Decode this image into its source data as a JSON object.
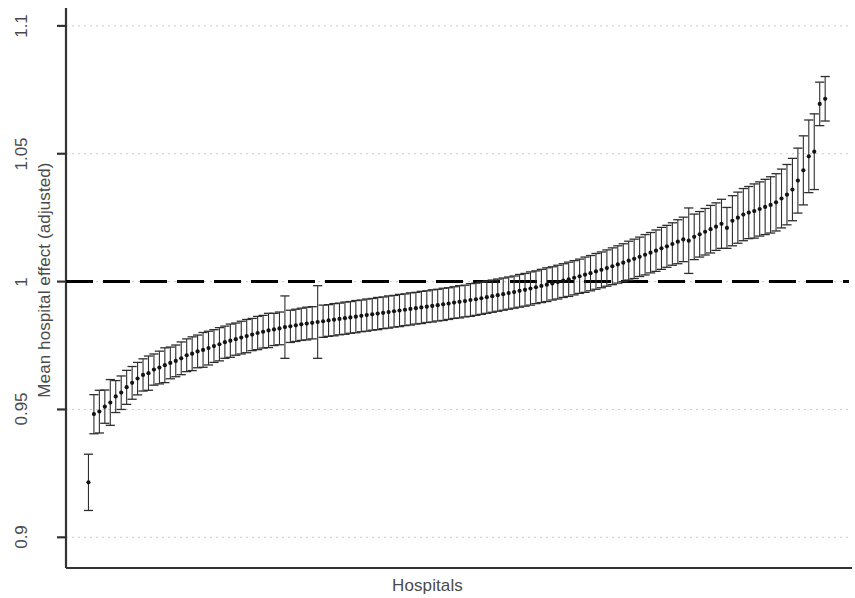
{
  "chart_data": {
    "type": "scatter",
    "title": "",
    "subtitle": "",
    "xlabel": "Hospitals",
    "ylabel": "Mean hospital effect (adjusted)",
    "ylim": [
      0.888,
      1.107
    ],
    "xlim": [
      0,
      140
    ],
    "grid": true,
    "grid_axis": "y",
    "grid_style": "dotted",
    "grid_color": "#c8c8c8",
    "legend": "none",
    "marker": "filled-circle",
    "marker_color": "#1a1a1a",
    "errorbar_style": "capped-vertical",
    "errorbar_color": "#333333",
    "yticks": [
      0.9,
      0.95,
      1,
      1.05,
      1.1
    ],
    "ytick_labels": [
      "0.9",
      "0.95",
      "1",
      "1.05",
      "1.1"
    ],
    "xticks": [],
    "xtick_labels": [],
    "annotations": [
      {
        "type": "hline",
        "y": 1,
        "style": "dashed",
        "color": "#000000",
        "width": 3,
        "label": "reference line at 1"
      }
    ],
    "series_name": "Mean hospital effect (adjusted) with 95% CI",
    "n_points": 136,
    "points": [
      {
        "x": 1,
        "y": 0.9215,
        "lo": 0.9105,
        "hi": 0.9325
      },
      {
        "x": 2,
        "y": 0.9482,
        "lo": 0.9405,
        "hi": 0.9558
      },
      {
        "x": 3,
        "y": 0.9492,
        "lo": 0.9408,
        "hi": 0.9575
      },
      {
        "x": 4,
        "y": 0.9511,
        "lo": 0.9446,
        "hi": 0.9576
      },
      {
        "x": 5,
        "y": 0.9527,
        "lo": 0.9438,
        "hi": 0.9617
      },
      {
        "x": 6,
        "y": 0.9551,
        "lo": 0.9488,
        "hi": 0.9613
      },
      {
        "x": 7,
        "y": 0.9566,
        "lo": 0.95,
        "hi": 0.9631
      },
      {
        "x": 8,
        "y": 0.9587,
        "lo": 0.952,
        "hi": 0.9653
      },
      {
        "x": 9,
        "y": 0.9604,
        "lo": 0.954,
        "hi": 0.9668
      },
      {
        "x": 10,
        "y": 0.9621,
        "lo": 0.9557,
        "hi": 0.9684
      },
      {
        "x": 11,
        "y": 0.9635,
        "lo": 0.9572,
        "hi": 0.9698
      },
      {
        "x": 12,
        "y": 0.9642,
        "lo": 0.9575,
        "hi": 0.9709
      },
      {
        "x": 13,
        "y": 0.9656,
        "lo": 0.9595,
        "hi": 0.9717
      },
      {
        "x": 14,
        "y": 0.9664,
        "lo": 0.96,
        "hi": 0.9728
      },
      {
        "x": 15,
        "y": 0.9673,
        "lo": 0.9605,
        "hi": 0.9741
      },
      {
        "x": 16,
        "y": 0.9682,
        "lo": 0.962,
        "hi": 0.9744
      },
      {
        "x": 17,
        "y": 0.969,
        "lo": 0.9628,
        "hi": 0.9752
      },
      {
        "x": 18,
        "y": 0.97,
        "lo": 0.9636,
        "hi": 0.9764
      },
      {
        "x": 19,
        "y": 0.9712,
        "lo": 0.9648,
        "hi": 0.9776
      },
      {
        "x": 20,
        "y": 0.9718,
        "lo": 0.9652,
        "hi": 0.9784
      },
      {
        "x": 21,
        "y": 0.9727,
        "lo": 0.9663,
        "hi": 0.9791
      },
      {
        "x": 22,
        "y": 0.9733,
        "lo": 0.9665,
        "hi": 0.9801
      },
      {
        "x": 23,
        "y": 0.974,
        "lo": 0.9674,
        "hi": 0.9806
      },
      {
        "x": 24,
        "y": 0.9748,
        "lo": 0.9684,
        "hi": 0.9812
      },
      {
        "x": 25,
        "y": 0.9755,
        "lo": 0.969,
        "hi": 0.982
      },
      {
        "x": 26,
        "y": 0.9763,
        "lo": 0.97,
        "hi": 0.9826
      },
      {
        "x": 27,
        "y": 0.9769,
        "lo": 0.9704,
        "hi": 0.9834
      },
      {
        "x": 28,
        "y": 0.9775,
        "lo": 0.9712,
        "hi": 0.9838
      },
      {
        "x": 29,
        "y": 0.9781,
        "lo": 0.9717,
        "hi": 0.9845
      },
      {
        "x": 30,
        "y": 0.9787,
        "lo": 0.9722,
        "hi": 0.9852
      },
      {
        "x": 31,
        "y": 0.9793,
        "lo": 0.973,
        "hi": 0.9856
      },
      {
        "x": 32,
        "y": 0.9799,
        "lo": 0.9734,
        "hi": 0.9864
      },
      {
        "x": 33,
        "y": 0.9804,
        "lo": 0.974,
        "hi": 0.9868
      },
      {
        "x": 34,
        "y": 0.9809,
        "lo": 0.9742,
        "hi": 0.9876
      },
      {
        "x": 35,
        "y": 0.9813,
        "lo": 0.975,
        "hi": 0.9876
      },
      {
        "x": 36,
        "y": 0.9817,
        "lo": 0.9753,
        "hi": 0.9881
      },
      {
        "x": 37,
        "y": 0.9822,
        "lo": 0.97,
        "hi": 0.9944
      },
      {
        "x": 38,
        "y": 0.9825,
        "lo": 0.9762,
        "hi": 0.9888
      },
      {
        "x": 39,
        "y": 0.9829,
        "lo": 0.9766,
        "hi": 0.9892
      },
      {
        "x": 40,
        "y": 0.9833,
        "lo": 0.977,
        "hi": 0.9896
      },
      {
        "x": 41,
        "y": 0.9836,
        "lo": 0.9772,
        "hi": 0.99
      },
      {
        "x": 42,
        "y": 0.9839,
        "lo": 0.9776,
        "hi": 0.9902
      },
      {
        "x": 43,
        "y": 0.9842,
        "lo": 0.97,
        "hi": 0.9984
      },
      {
        "x": 44,
        "y": 0.9845,
        "lo": 0.9782,
        "hi": 0.9908
      },
      {
        "x": 45,
        "y": 0.9848,
        "lo": 0.9786,
        "hi": 0.991
      },
      {
        "x": 46,
        "y": 0.9851,
        "lo": 0.9788,
        "hi": 0.9914
      },
      {
        "x": 47,
        "y": 0.9854,
        "lo": 0.9792,
        "hi": 0.9916
      },
      {
        "x": 48,
        "y": 0.9857,
        "lo": 0.9794,
        "hi": 0.992
      },
      {
        "x": 49,
        "y": 0.986,
        "lo": 0.9798,
        "hi": 0.9922
      },
      {
        "x": 50,
        "y": 0.9863,
        "lo": 0.98,
        "hi": 0.9926
      },
      {
        "x": 51,
        "y": 0.9866,
        "lo": 0.9804,
        "hi": 0.9928
      },
      {
        "x": 52,
        "y": 0.9869,
        "lo": 0.9806,
        "hi": 0.9932
      },
      {
        "x": 53,
        "y": 0.9872,
        "lo": 0.981,
        "hi": 0.9934
      },
      {
        "x": 54,
        "y": 0.9875,
        "lo": 0.9812,
        "hi": 0.9938
      },
      {
        "x": 55,
        "y": 0.9878,
        "lo": 0.9816,
        "hi": 0.994
      },
      {
        "x": 56,
        "y": 0.9881,
        "lo": 0.9818,
        "hi": 0.9944
      },
      {
        "x": 57,
        "y": 0.9884,
        "lo": 0.9822,
        "hi": 0.9946
      },
      {
        "x": 58,
        "y": 0.9887,
        "lo": 0.9824,
        "hi": 0.995
      },
      {
        "x": 59,
        "y": 0.989,
        "lo": 0.9828,
        "hi": 0.9952
      },
      {
        "x": 60,
        "y": 0.9893,
        "lo": 0.983,
        "hi": 0.9956
      },
      {
        "x": 61,
        "y": 0.9896,
        "lo": 0.9834,
        "hi": 0.9958
      },
      {
        "x": 62,
        "y": 0.9899,
        "lo": 0.9836,
        "hi": 0.9962
      },
      {
        "x": 63,
        "y": 0.9902,
        "lo": 0.984,
        "hi": 0.9964
      },
      {
        "x": 64,
        "y": 0.9905,
        "lo": 0.9842,
        "hi": 0.9968
      },
      {
        "x": 65,
        "y": 0.9908,
        "lo": 0.9846,
        "hi": 0.997
      },
      {
        "x": 66,
        "y": 0.9911,
        "lo": 0.9848,
        "hi": 0.9974
      },
      {
        "x": 67,
        "y": 0.9914,
        "lo": 0.9852,
        "hi": 0.9976
      },
      {
        "x": 68,
        "y": 0.9918,
        "lo": 0.9856,
        "hi": 0.998
      },
      {
        "x": 69,
        "y": 0.9921,
        "lo": 0.9858,
        "hi": 0.9984
      },
      {
        "x": 70,
        "y": 0.9924,
        "lo": 0.9862,
        "hi": 0.9986
      },
      {
        "x": 71,
        "y": 0.9928,
        "lo": 0.9864,
        "hi": 0.9992
      },
      {
        "x": 72,
        "y": 0.9931,
        "lo": 0.9868,
        "hi": 0.9994
      },
      {
        "x": 73,
        "y": 0.9935,
        "lo": 0.9872,
        "hi": 0.9998
      },
      {
        "x": 74,
        "y": 0.9939,
        "lo": 0.9876,
        "hi": 1.0002
      },
      {
        "x": 75,
        "y": 0.9943,
        "lo": 0.988,
        "hi": 1.0006
      },
      {
        "x": 76,
        "y": 0.9947,
        "lo": 0.9884,
        "hi": 1.001
      },
      {
        "x": 77,
        "y": 0.9951,
        "lo": 0.9888,
        "hi": 1.0014
      },
      {
        "x": 78,
        "y": 0.9955,
        "lo": 0.9892,
        "hi": 1.0018
      },
      {
        "x": 79,
        "y": 0.9959,
        "lo": 0.9896,
        "hi": 1.0022
      },
      {
        "x": 80,
        "y": 0.9964,
        "lo": 0.99,
        "hi": 1.0028
      },
      {
        "x": 81,
        "y": 0.9968,
        "lo": 0.9904,
        "hi": 1.0032
      },
      {
        "x": 82,
        "y": 0.9973,
        "lo": 0.9908,
        "hi": 1.0038
      },
      {
        "x": 83,
        "y": 0.9978,
        "lo": 0.9914,
        "hi": 1.0042
      },
      {
        "x": 84,
        "y": 0.9983,
        "lo": 0.9918,
        "hi": 1.0048
      },
      {
        "x": 85,
        "y": 0.9988,
        "lo": 0.9922,
        "hi": 1.0054
      },
      {
        "x": 86,
        "y": 0.9993,
        "lo": 0.9928,
        "hi": 1.0058
      },
      {
        "x": 87,
        "y": 0.9998,
        "lo": 0.9932,
        "hi": 1.0064
      },
      {
        "x": 88,
        "y": 1.0004,
        "lo": 0.9938,
        "hi": 1.007
      },
      {
        "x": 89,
        "y": 1.0009,
        "lo": 0.9942,
        "hi": 1.0076
      },
      {
        "x": 90,
        "y": 1.0015,
        "lo": 0.9948,
        "hi": 1.0082
      },
      {
        "x": 91,
        "y": 1.0021,
        "lo": 0.9954,
        "hi": 1.0088
      },
      {
        "x": 92,
        "y": 1.0027,
        "lo": 0.9958,
        "hi": 1.0096
      },
      {
        "x": 93,
        "y": 1.0033,
        "lo": 0.9964,
        "hi": 1.0102
      },
      {
        "x": 94,
        "y": 1.004,
        "lo": 0.997,
        "hi": 1.011
      },
      {
        "x": 95,
        "y": 1.0046,
        "lo": 0.9976,
        "hi": 1.0116
      },
      {
        "x": 96,
        "y": 1.0053,
        "lo": 0.9982,
        "hi": 1.0124
      },
      {
        "x": 97,
        "y": 1.006,
        "lo": 0.9988,
        "hi": 1.0132
      },
      {
        "x": 98,
        "y": 1.0067,
        "lo": 0.9994,
        "hi": 1.014
      },
      {
        "x": 99,
        "y": 1.0074,
        "lo": 1.0,
        "hi": 1.0148
      },
      {
        "x": 100,
        "y": 1.0082,
        "lo": 1.0006,
        "hi": 1.0158
      },
      {
        "x": 101,
        "y": 1.0089,
        "lo": 1.0012,
        "hi": 1.0166
      },
      {
        "x": 102,
        "y": 1.0097,
        "lo": 1.002,
        "hi": 1.0174
      },
      {
        "x": 103,
        "y": 1.0105,
        "lo": 1.0026,
        "hi": 1.0184
      },
      {
        "x": 104,
        "y": 1.0113,
        "lo": 1.0034,
        "hi": 1.0192
      },
      {
        "x": 105,
        "y": 1.0121,
        "lo": 1.004,
        "hi": 1.0202
      },
      {
        "x": 106,
        "y": 1.013,
        "lo": 1.0048,
        "hi": 1.0212
      },
      {
        "x": 107,
        "y": 1.0138,
        "lo": 1.0056,
        "hi": 1.022
      },
      {
        "x": 108,
        "y": 1.0147,
        "lo": 1.0064,
        "hi": 1.023
      },
      {
        "x": 109,
        "y": 1.0156,
        "lo": 1.007,
        "hi": 1.0242
      },
      {
        "x": 110,
        "y": 1.0165,
        "lo": 1.0078,
        "hi": 1.0252
      },
      {
        "x": 111,
        "y": 1.016,
        "lo": 1.0032,
        "hi": 1.0288
      },
      {
        "x": 112,
        "y": 1.0175,
        "lo": 1.0086,
        "hi": 1.0264
      },
      {
        "x": 113,
        "y": 1.0185,
        "lo": 1.0096,
        "hi": 1.0274
      },
      {
        "x": 114,
        "y": 1.0195,
        "lo": 1.0104,
        "hi": 1.0286
      },
      {
        "x": 115,
        "y": 1.0205,
        "lo": 1.0112,
        "hi": 1.0298
      },
      {
        "x": 116,
        "y": 1.0215,
        "lo": 1.0122,
        "hi": 1.0308
      },
      {
        "x": 117,
        "y": 1.0226,
        "lo": 1.013,
        "hi": 1.0322
      },
      {
        "x": 118,
        "y": 1.021,
        "lo": 1.013,
        "hi": 1.029
      },
      {
        "x": 119,
        "y": 1.0238,
        "lo": 1.014,
        "hi": 1.0336
      },
      {
        "x": 120,
        "y": 1.025,
        "lo": 1.015,
        "hi": 1.035
      },
      {
        "x": 121,
        "y": 1.0262,
        "lo": 1.016,
        "hi": 1.0364
      },
      {
        "x": 122,
        "y": 1.027,
        "lo": 1.0168,
        "hi": 1.0372
      },
      {
        "x": 123,
        "y": 1.0276,
        "lo": 1.017,
        "hi": 1.0382
      },
      {
        "x": 124,
        "y": 1.0284,
        "lo": 1.0178,
        "hi": 1.039
      },
      {
        "x": 125,
        "y": 1.0292,
        "lo": 1.0184,
        "hi": 1.04
      },
      {
        "x": 126,
        "y": 1.03,
        "lo": 1.019,
        "hi": 1.041
      },
      {
        "x": 127,
        "y": 1.031,
        "lo": 1.0198,
        "hi": 1.0422
      },
      {
        "x": 128,
        "y": 1.0325,
        "lo": 1.021,
        "hi": 1.044
      },
      {
        "x": 129,
        "y": 1.034,
        "lo": 1.0222,
        "hi": 1.0458
      },
      {
        "x": 130,
        "y": 1.036,
        "lo": 1.0238,
        "hi": 1.0482
      },
      {
        "x": 131,
        "y": 1.0395,
        "lo": 1.0268,
        "hi": 1.0522
      },
      {
        "x": 132,
        "y": 1.0435,
        "lo": 1.03,
        "hi": 1.057
      },
      {
        "x": 133,
        "y": 1.049,
        "lo": 1.0348,
        "hi": 1.0632
      },
      {
        "x": 134,
        "y": 1.0508,
        "lo": 1.036,
        "hi": 1.0656
      },
      {
        "x": 135,
        "y": 1.0695,
        "lo": 1.061,
        "hi": 1.078
      },
      {
        "x": 136,
        "y": 1.0715,
        "lo": 1.0628,
        "hi": 1.0802
      }
    ]
  },
  "axes": {
    "y_label": "Mean hospital effect (adjusted)",
    "x_label": "Hospitals",
    "y_tick_labels": [
      "1.1",
      "1.05",
      "1",
      "0.95",
      "0.9"
    ]
  },
  "colors": {
    "axis": "#333333",
    "grid": "#c9c9c9",
    "marker": "#141414",
    "errorbar": "#2e2e2e",
    "reference_line": "#000000",
    "text": "#4a4a4a",
    "background": "#ffffff"
  }
}
